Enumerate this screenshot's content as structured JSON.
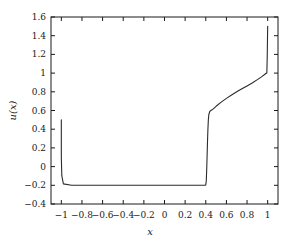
{
  "chart_data": {
    "type": "line",
    "title": "",
    "xlabel": "x",
    "ylabel": "u(x)",
    "xlim": [
      -1.1,
      1.1
    ],
    "ylim": [
      -0.4,
      1.6
    ],
    "grid": false,
    "legend": null,
    "xticks": [
      -1,
      -0.8,
      -0.6,
      -0.4,
      -0.2,
      0,
      0.2,
      0.4,
      0.6,
      0.8,
      1
    ],
    "xtick_labels": [
      "−1",
      "−0.8",
      "−0.6",
      "−0.4",
      "−0.2",
      "0",
      "0.2",
      "0.4",
      "0.6",
      "0.8",
      "1"
    ],
    "yticks": [
      -0.4,
      -0.2,
      0,
      0.2,
      0.4,
      0.6,
      0.8,
      1,
      1.2,
      1.4,
      1.6
    ],
    "ytick_labels": [
      "−0.4",
      "−0.2",
      "0",
      "0.2",
      "0.4",
      "0.6",
      "0.8",
      "1",
      "1.2",
      "1.4",
      "1.6"
    ],
    "line_color": "#2b2b2b",
    "line_width": 1.1,
    "series": [
      {
        "name": "u",
        "x": [
          -1.0,
          -1.0,
          -0.995,
          -0.98,
          -0.9,
          -0.8,
          -0.7,
          -0.6,
          -0.5,
          -0.4,
          -0.3,
          -0.2,
          -0.1,
          0.0,
          0.1,
          0.2,
          0.3,
          0.35,
          0.38,
          0.395,
          0.4,
          0.405,
          0.41,
          0.415,
          0.42,
          0.425,
          0.43,
          0.44,
          0.45,
          0.47,
          0.5,
          0.55,
          0.6,
          0.65,
          0.7,
          0.75,
          0.8,
          0.85,
          0.9,
          0.94,
          0.97,
          0.985,
          0.992,
          0.996,
          1.0
        ],
        "y": [
          0.5,
          0.1,
          -0.1,
          -0.185,
          -0.2,
          -0.2,
          -0.2,
          -0.2,
          -0.2,
          -0.2,
          -0.2,
          -0.2,
          -0.2,
          -0.2,
          -0.2,
          -0.2,
          -0.2,
          -0.2,
          -0.2,
          -0.2,
          -0.195,
          -0.15,
          0.0,
          0.2,
          0.38,
          0.5,
          0.56,
          0.592,
          0.6,
          0.615,
          0.645,
          0.69,
          0.73,
          0.765,
          0.8,
          0.832,
          0.863,
          0.895,
          0.93,
          0.96,
          0.985,
          0.998,
          1.0,
          1.2,
          1.5
        ]
      }
    ]
  },
  "axes": {
    "frame_color": "#1a1a1a",
    "background": "#ffffff"
  }
}
